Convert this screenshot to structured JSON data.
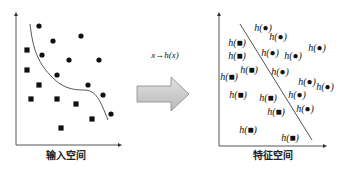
{
  "left_panel": {
    "caption": "输入空间",
    "circles": [
      [
        39,
        26
      ],
      [
        53,
        41
      ],
      [
        81,
        36
      ],
      [
        42,
        55
      ],
      [
        69,
        60
      ],
      [
        99,
        60
      ],
      [
        57,
        75
      ],
      [
        88,
        85
      ],
      [
        103,
        95
      ],
      [
        111,
        114
      ]
    ],
    "squares": [
      [
        27,
        50
      ],
      [
        27,
        70
      ],
      [
        39,
        85
      ],
      [
        31,
        99
      ],
      [
        57,
        99
      ],
      [
        76,
        104
      ],
      [
        92,
        119
      ],
      [
        61,
        128
      ]
    ],
    "curve": "M30,24 C33,50 38,62 50,75 C62,88 72,90 84,90 C96,90 100,100 108,120"
  },
  "mapping": {
    "label": "x→h(x)",
    "arrow_color": "#c8c8c8"
  },
  "right_panel": {
    "caption": "特征空间",
    "circle_label": "h(●)",
    "square_label": "h(■)",
    "circle_items": [
      [
        263,
        27
      ],
      [
        278,
        36
      ],
      [
        317,
        47
      ],
      [
        270,
        52
      ],
      [
        293,
        55
      ],
      [
        280,
        71
      ],
      [
        307,
        81
      ],
      [
        325,
        86
      ],
      [
        297,
        94
      ],
      [
        305,
        108
      ]
    ],
    "square_items": [
      [
        237,
        42
      ],
      [
        237,
        55
      ],
      [
        249,
        69
      ],
      [
        229,
        76
      ],
      [
        238,
        94
      ],
      [
        268,
        97
      ],
      [
        276,
        111
      ],
      [
        248,
        129
      ],
      [
        290,
        137
      ]
    ],
    "separator": [
      240,
      24,
      312,
      140
    ]
  }
}
